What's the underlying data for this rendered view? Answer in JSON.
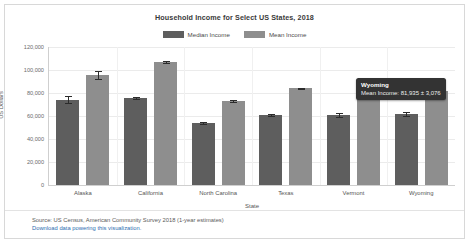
{
  "chart_data": {
    "type": "bar",
    "title": "Household Income for Select US States, 2018",
    "xlabel": "State",
    "ylabel": "US Dollars",
    "ylim": [
      0,
      120000
    ],
    "ytick_labels": [
      "120,000",
      "100,000",
      "80,000",
      "60,000",
      "40,000",
      "20,000",
      "0"
    ],
    "ytick_values": [
      120000,
      100000,
      80000,
      60000,
      40000,
      20000,
      0
    ],
    "grid": true,
    "legend_position": "top-center",
    "categories": [
      "Alaska",
      "California",
      "North Carolina",
      "Texas",
      "Vermont",
      "Wyoming"
    ],
    "series": [
      {
        "name": "Median Income",
        "color": "#5e5e5e",
        "values": [
          74346,
          75277,
          53855,
          60629,
          60782,
          61584
        ],
        "errors": [
          2900,
          900,
          750,
          700,
          1850,
          1750
        ]
      },
      {
        "name": "Mean Income",
        "color": "#8e8e8e",
        "values": [
          95300,
          107000,
          73300,
          84000,
          79600,
          81935
        ],
        "errors": [
          3400,
          950,
          800,
          750,
          2100,
          3076
        ]
      }
    ]
  },
  "legend": {
    "entries": [
      {
        "label": "Median Income",
        "color": "#5e5e5e"
      },
      {
        "label": "Mean Income",
        "color": "#8e8e8e"
      }
    ]
  },
  "tooltip": {
    "title": "Wyoming",
    "body": "Mean Income: 81,935 ± 3,076"
  },
  "footer": {
    "source": "Source: US Census, American Community Survey 2018 (1-year estimates)",
    "link": "Download data powering this visualization."
  }
}
